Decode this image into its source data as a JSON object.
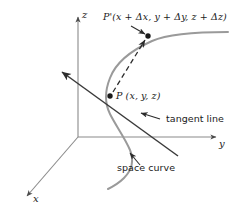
{
  "figure": {
    "width": 236,
    "height": 217,
    "background_color": "#ffffff"
  },
  "colors": {
    "axis": "#8a8a8a",
    "space_curve": "#9a9a9a",
    "tangent_line": "#3a3a3a",
    "secant_dashed": "#2b2b2b",
    "text": "#1a1a1a",
    "leader": "#2b2b2b"
  },
  "axes": [
    {
      "id": "z",
      "label": "z",
      "direction": "up",
      "arrow": true
    },
    {
      "id": "y",
      "label": "y",
      "direction": "right",
      "arrow": true
    },
    {
      "id": "x",
      "label": "x",
      "direction": "down-left",
      "arrow": true
    }
  ],
  "points": [
    {
      "id": "P",
      "label": "P (x, y, z)",
      "marker": "filled-dot"
    },
    {
      "id": "P-prime",
      "label": "P'(x + Δx, y + Δy, z + Δz)",
      "marker": "filled-dot"
    }
  ],
  "annotations": [
    {
      "id": "tangent-line",
      "label": "tangent line",
      "leader": "arrow-up-left"
    },
    {
      "id": "space-curve",
      "label": "space curve",
      "leader": "arrow-up-left"
    }
  ],
  "elements": {
    "secant_style": "dashed",
    "tangent_style": "solid-with-arrowhead",
    "curve_style": "solid-gray"
  }
}
